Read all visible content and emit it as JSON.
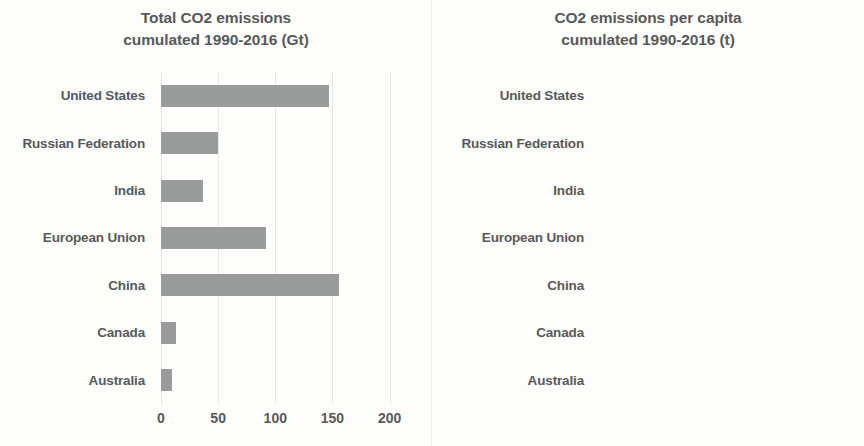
{
  "chart_data": [
    {
      "type": "bar",
      "orientation": "horizontal",
      "title": "Total CO2 emissions cumulated 1990-2016 (Gt)",
      "title_lines": [
        "Total CO2 emissions",
        "cumulated 1990-2016 (Gt)"
      ],
      "xlabel": "",
      "ylabel": "",
      "categories": [
        "United States",
        "Russian Federation",
        "India",
        "European Union",
        "China",
        "Canada",
        "Australia"
      ],
      "values": [
        147,
        50,
        37,
        92,
        156,
        13,
        10
      ],
      "xlim": [
        0,
        210
      ],
      "xticks": [
        0,
        50,
        100,
        150,
        200
      ],
      "xticklabels": [
        "0",
        "50",
        "100",
        "150",
        "200"
      ],
      "grid": true,
      "grid_axis": "x",
      "legend": false,
      "bar_color": "#9a9b9b",
      "units": "Gt"
    },
    {
      "type": "bar",
      "orientation": "horizontal",
      "title": "CO2 emissions per capita cumulated 1990-2016 (t)",
      "title_lines": [
        "CO2 emissions per capita",
        "cumulated 1990-2016 (t)"
      ],
      "xlabel": "",
      "ylabel": "",
      "categories": [
        "United States",
        "Russian Federation",
        "India",
        "European Union",
        "China",
        "Canada",
        "Australia"
      ],
      "values": [
        486,
        350,
        33,
        208,
        124,
        428,
        437
      ],
      "xlim": [
        0,
        600
      ],
      "xticks": [
        0,
        100,
        200,
        300,
        400,
        500,
        600
      ],
      "xticklabels": [
        "0",
        "100",
        "200",
        "300",
        "400",
        "500",
        "60"
      ],
      "grid": true,
      "grid_axis": "x",
      "legend": false,
      "bar_color": "#9a9b9b",
      "units": "t"
    }
  ],
  "left_chart": {
    "title_line1": "Total CO2 emissions",
    "title_line2": "cumulated 1990-2016 (Gt)",
    "categories": [
      {
        "label": "United States",
        "value": 147
      },
      {
        "label": "Russian Federation",
        "value": 50
      },
      {
        "label": "India",
        "value": 37
      },
      {
        "label": "European Union",
        "value": 92
      },
      {
        "label": "China",
        "value": 156
      },
      {
        "label": "Canada",
        "value": 13
      },
      {
        "label": "Australia",
        "value": 10
      }
    ],
    "ticks": [
      {
        "label": "0",
        "value": 0
      },
      {
        "label": "50",
        "value": 50
      },
      {
        "label": "100",
        "value": 100
      },
      {
        "label": "150",
        "value": 150
      },
      {
        "label": "200",
        "value": 200
      }
    ],
    "axis_max": 210
  },
  "right_chart": {
    "title_line1": "CO2 emissions per capita",
    "title_line2": "cumulated 1990-2016 (t)",
    "categories": [
      {
        "label": "United States",
        "value": 486
      },
      {
        "label": "Russian Federation",
        "value": 350
      },
      {
        "label": "India",
        "value": 33
      },
      {
        "label": "European Union",
        "value": 208
      },
      {
        "label": "China",
        "value": 124
      },
      {
        "label": "Canada",
        "value": 428
      },
      {
        "label": "Australia",
        "value": 437
      }
    ],
    "ticks": [
      {
        "label": "0",
        "value": 0
      },
      {
        "label": "100",
        "value": 100
      },
      {
        "label": "200",
        "value": 200
      },
      {
        "label": "300",
        "value": 300
      },
      {
        "label": "400",
        "value": 400
      },
      {
        "label": "500",
        "value": 500
      },
      {
        "label": "60",
        "value": 600
      }
    ],
    "axis_max": 618
  },
  "style": {
    "bar_color": "#9a9b9b",
    "grid_color": "#e9e9e7",
    "text_color": "#58595b",
    "background": "#fdfdfc"
  }
}
